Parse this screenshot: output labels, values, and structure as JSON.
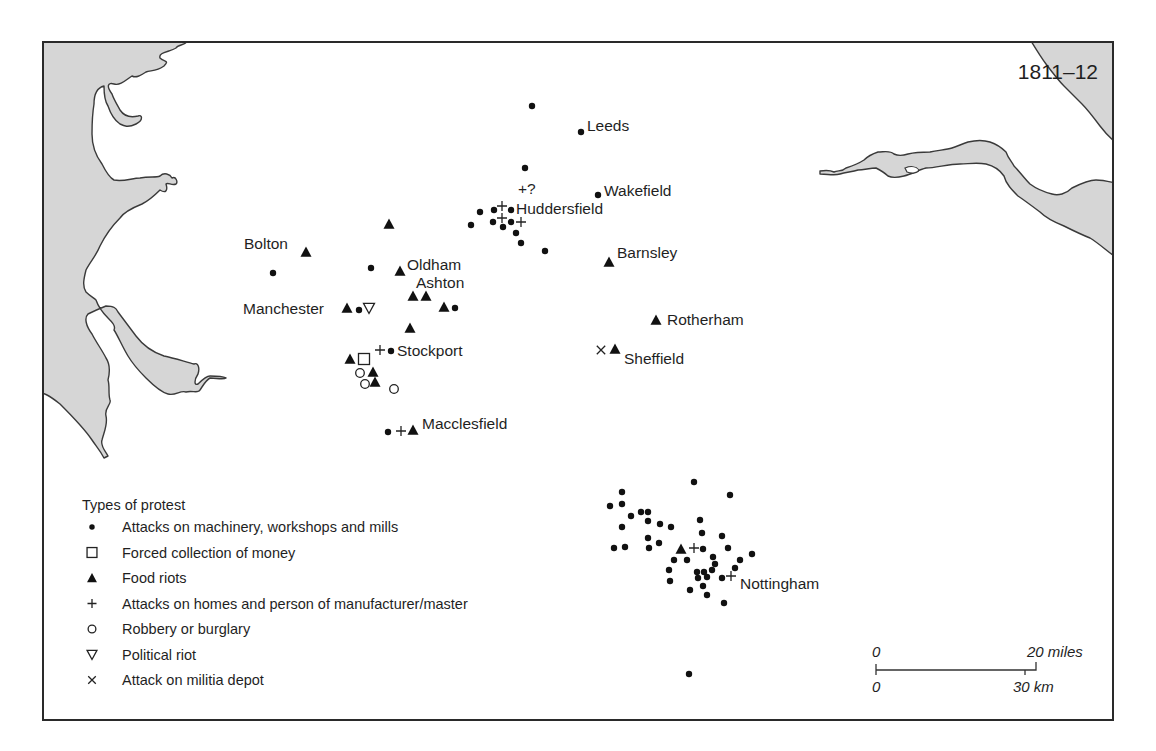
{
  "map": {
    "title_year": "1811–12",
    "legend": {
      "title": "Types of protest",
      "items": [
        {
          "symbol": "dot",
          "icon": "filled-circle-icon",
          "label": "Attacks on machinery, workshops and mills"
        },
        {
          "symbol": "square",
          "icon": "open-square-icon",
          "label": "Forced collection of money"
        },
        {
          "symbol": "triangle",
          "icon": "filled-triangle-icon",
          "label": "Food riots"
        },
        {
          "symbol": "plus",
          "icon": "plus-icon",
          "label": "Attacks on homes and person of manufacturer/master"
        },
        {
          "symbol": "circle",
          "icon": "open-circle-icon",
          "label": "Robbery or burglary"
        },
        {
          "symbol": "down-triangle",
          "icon": "open-down-triangle-icon",
          "label": "Political riot"
        },
        {
          "symbol": "cross",
          "icon": "x-cross-icon",
          "label": "Attack on militia depot"
        }
      ]
    },
    "scale_bar": {
      "miles_start": "0",
      "miles_end": "20 miles",
      "km_start": "0",
      "km_end": "30 km"
    },
    "places": [
      {
        "name": "Leeds",
        "x": 587,
        "y": 131
      },
      {
        "name": "Wakefield",
        "x": 604,
        "y": 196
      },
      {
        "name": "Huddersfield",
        "x": 516,
        "y": 214
      },
      {
        "name": "Bolton",
        "x": 244,
        "y": 249
      },
      {
        "name": "Barnsley",
        "x": 617,
        "y": 258
      },
      {
        "name": "Oldham",
        "x": 407,
        "y": 270
      },
      {
        "name": "Ashton",
        "x": 416,
        "y": 288
      },
      {
        "name": "Manchester",
        "x": 243,
        "y": 314
      },
      {
        "name": "Rotherham",
        "x": 667,
        "y": 325
      },
      {
        "name": "Stockport",
        "x": 397,
        "y": 356
      },
      {
        "name": "Sheffield",
        "x": 624,
        "y": 364
      },
      {
        "name": "Macclesfield",
        "x": 422,
        "y": 429
      },
      {
        "name": "Nottingham",
        "x": 740,
        "y": 589
      }
    ],
    "annotations": [
      {
        "text": "+?",
        "x": 518,
        "y": 194
      }
    ],
    "markers": [
      {
        "type": "dot",
        "x": 532,
        "y": 106
      },
      {
        "type": "dot",
        "x": 581,
        "y": 132
      },
      {
        "type": "dot",
        "x": 525,
        "y": 168
      },
      {
        "type": "dot",
        "x": 598,
        "y": 195
      },
      {
        "type": "dot",
        "x": 480,
        "y": 212
      },
      {
        "type": "dot",
        "x": 494,
        "y": 210
      },
      {
        "type": "plus",
        "x": 502,
        "y": 206
      },
      {
        "type": "dot",
        "x": 511,
        "y": 210
      },
      {
        "type": "dot",
        "x": 471,
        "y": 225
      },
      {
        "type": "dot",
        "x": 493,
        "y": 222
      },
      {
        "type": "plus",
        "x": 502,
        "y": 218
      },
      {
        "type": "dot",
        "x": 503,
        "y": 227
      },
      {
        "type": "dot",
        "x": 511,
        "y": 222
      },
      {
        "type": "plus",
        "x": 521,
        "y": 222
      },
      {
        "type": "dot",
        "x": 516,
        "y": 233
      },
      {
        "type": "dot",
        "x": 521,
        "y": 243
      },
      {
        "type": "dot",
        "x": 545,
        "y": 251
      },
      {
        "type": "triangle",
        "x": 389,
        "y": 224
      },
      {
        "type": "triangle",
        "x": 306,
        "y": 252
      },
      {
        "type": "dot",
        "x": 273,
        "y": 273
      },
      {
        "type": "dot",
        "x": 371,
        "y": 268
      },
      {
        "type": "triangle",
        "x": 400,
        "y": 271
      },
      {
        "type": "triangle",
        "x": 609,
        "y": 262
      },
      {
        "type": "triangle",
        "x": 413,
        "y": 296
      },
      {
        "type": "triangle",
        "x": 426,
        "y": 296
      },
      {
        "type": "triangle",
        "x": 444,
        "y": 307
      },
      {
        "type": "dot",
        "x": 455,
        "y": 308
      },
      {
        "type": "triangle",
        "x": 347,
        "y": 308
      },
      {
        "type": "dot",
        "x": 359,
        "y": 310
      },
      {
        "type": "down-triangle",
        "x": 369,
        "y": 308
      },
      {
        "type": "triangle",
        "x": 410,
        "y": 328
      },
      {
        "type": "triangle",
        "x": 656,
        "y": 320
      },
      {
        "type": "plus",
        "x": 380,
        "y": 350
      },
      {
        "type": "dot",
        "x": 391,
        "y": 351
      },
      {
        "type": "triangle",
        "x": 350,
        "y": 359
      },
      {
        "type": "square",
        "x": 364,
        "y": 359
      },
      {
        "type": "circle",
        "x": 360,
        "y": 373
      },
      {
        "type": "triangle",
        "x": 373,
        "y": 372
      },
      {
        "type": "circle",
        "x": 365,
        "y": 384
      },
      {
        "type": "triangle",
        "x": 375,
        "y": 382
      },
      {
        "type": "circle",
        "x": 394,
        "y": 389
      },
      {
        "type": "cross",
        "x": 601,
        "y": 350
      },
      {
        "type": "triangle",
        "x": 615,
        "y": 349
      },
      {
        "type": "dot",
        "x": 388,
        "y": 432
      },
      {
        "type": "plus",
        "x": 401,
        "y": 431
      },
      {
        "type": "triangle",
        "x": 413,
        "y": 430
      },
      {
        "type": "dot",
        "x": 694,
        "y": 482
      },
      {
        "type": "dot",
        "x": 622,
        "y": 492
      },
      {
        "type": "dot",
        "x": 730,
        "y": 495
      },
      {
        "type": "dot",
        "x": 610,
        "y": 506
      },
      {
        "type": "dot",
        "x": 622,
        "y": 504
      },
      {
        "type": "dot",
        "x": 641,
        "y": 512
      },
      {
        "type": "dot",
        "x": 648,
        "y": 512
      },
      {
        "type": "dot",
        "x": 631,
        "y": 516
      },
      {
        "type": "dot",
        "x": 648,
        "y": 521
      },
      {
        "type": "dot",
        "x": 660,
        "y": 524
      },
      {
        "type": "dot",
        "x": 671,
        "y": 527
      },
      {
        "type": "dot",
        "x": 700,
        "y": 520
      },
      {
        "type": "dot",
        "x": 622,
        "y": 527
      },
      {
        "type": "dot",
        "x": 648,
        "y": 538
      },
      {
        "type": "dot",
        "x": 659,
        "y": 543
      },
      {
        "type": "dot",
        "x": 702,
        "y": 533
      },
      {
        "type": "dot",
        "x": 722,
        "y": 536
      },
      {
        "type": "dot",
        "x": 614,
        "y": 548
      },
      {
        "type": "dot",
        "x": 625,
        "y": 547
      },
      {
        "type": "dot",
        "x": 649,
        "y": 548
      },
      {
        "type": "triangle",
        "x": 681,
        "y": 549
      },
      {
        "type": "plus",
        "x": 694,
        "y": 548
      },
      {
        "type": "dot",
        "x": 703,
        "y": 549
      },
      {
        "type": "dot",
        "x": 728,
        "y": 548
      },
      {
        "type": "dot",
        "x": 752,
        "y": 554
      },
      {
        "type": "dot",
        "x": 674,
        "y": 560
      },
      {
        "type": "dot",
        "x": 687,
        "y": 560
      },
      {
        "type": "dot",
        "x": 713,
        "y": 557
      },
      {
        "type": "dot",
        "x": 740,
        "y": 560
      },
      {
        "type": "dot",
        "x": 715,
        "y": 564
      },
      {
        "type": "dot",
        "x": 669,
        "y": 570
      },
      {
        "type": "dot",
        "x": 712,
        "y": 570
      },
      {
        "type": "dot",
        "x": 735,
        "y": 568
      },
      {
        "type": "dot",
        "x": 697,
        "y": 572
      },
      {
        "type": "dot",
        "x": 704,
        "y": 572
      },
      {
        "type": "dot",
        "x": 707,
        "y": 577
      },
      {
        "type": "dot",
        "x": 698,
        "y": 578
      },
      {
        "type": "dot",
        "x": 722,
        "y": 578
      },
      {
        "type": "plus",
        "x": 731,
        "y": 576
      },
      {
        "type": "dot",
        "x": 670,
        "y": 581
      },
      {
        "type": "dot",
        "x": 703,
        "y": 586
      },
      {
        "type": "dot",
        "x": 690,
        "y": 590
      },
      {
        "type": "dot",
        "x": 707,
        "y": 595
      },
      {
        "type": "dot",
        "x": 724,
        "y": 603
      },
      {
        "type": "dot",
        "x": 689,
        "y": 674
      }
    ]
  }
}
